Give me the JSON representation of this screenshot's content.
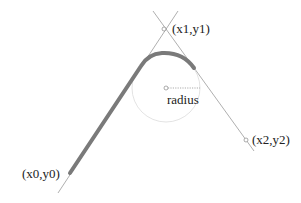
{
  "diagram": {
    "type": "arcTo-illustration",
    "labels": {
      "p0": "(x0,y0)",
      "p1": "(x1,y1)",
      "p2": "(x2,y2)",
      "radius": "radius"
    },
    "points": {
      "p0": [
        70,
        173
      ],
      "p1": [
        164,
        29
      ],
      "p2": [
        246,
        140
      ],
      "center": [
        166,
        88
      ]
    },
    "radius_px": 34,
    "colors": {
      "thick_path": "#7a7a7a",
      "guide_line": "#999999",
      "circle": "#d8d8d8",
      "text": "#222222"
    }
  }
}
